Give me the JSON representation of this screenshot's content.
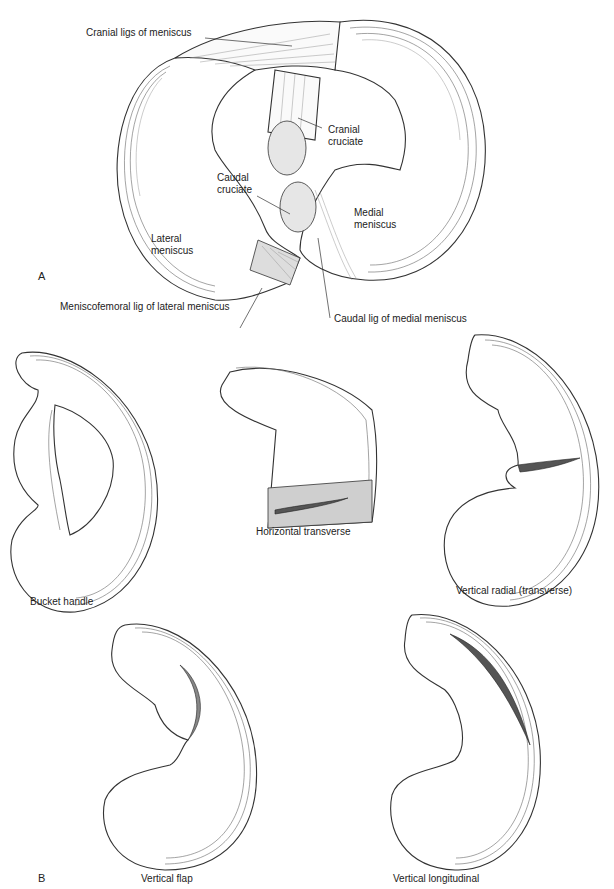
{
  "panel_a": {
    "letter": "A",
    "labels": {
      "cranial_ligs": "Cranial ligs of meniscus",
      "cranial_cruciate": [
        "Cranial",
        "cruciate"
      ],
      "caudal_cruciate": [
        "Caudal",
        "cruciate"
      ],
      "medial_meniscus": [
        "Medial",
        "meniscus"
      ],
      "lateral_meniscus": [
        "Lateral",
        "meniscus"
      ],
      "caudal_lig_medial": "Caudal lig of medial meniscus",
      "meniscofemoral_lig": "Meniscofemoral lig of lateral meniscus"
    }
  },
  "panel_b": {
    "letter": "B",
    "tears": [
      {
        "name": "Bucket handle"
      },
      {
        "name": "Horizontal transverse"
      },
      {
        "name": "Vertical radial (transverse)"
      },
      {
        "name": "Vertical flap"
      },
      {
        "name": "Vertical longitudinal"
      }
    ]
  }
}
